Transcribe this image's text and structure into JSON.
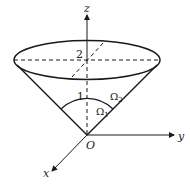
{
  "diagram": {
    "type": "3d-cone-region",
    "axes": {
      "x_label": "x",
      "y_label": "y",
      "z_label": "z",
      "origin_label": "O"
    },
    "labels": {
      "height_mark": "2",
      "arc_mark": "1",
      "region_outer": "Ω",
      "region_outer_sub": "2",
      "region_inner": "Ω",
      "region_inner_sub": "1"
    },
    "colors": {
      "stroke": "#1a1a1a",
      "background": "#ffffff"
    }
  }
}
